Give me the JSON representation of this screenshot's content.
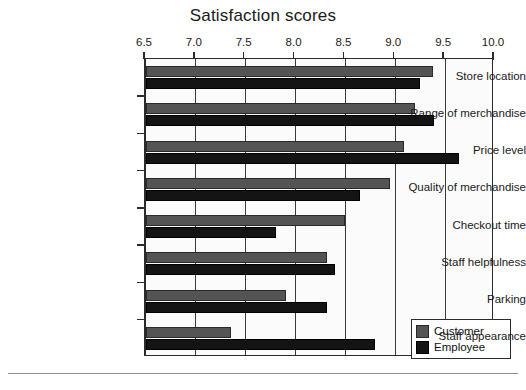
{
  "chart_data": {
    "type": "bar",
    "orientation": "horizontal",
    "grouped": true,
    "title": "Satisfaction scores",
    "xlabel": "",
    "ylabel": "",
    "xlim": [
      6.5,
      10.0
    ],
    "xticks": [
      "6.5",
      "7.0",
      "7.5",
      "8.0",
      "8.5",
      "9.0",
      "9.5",
      "10.0"
    ],
    "xtick_values": [
      6.5,
      7.0,
      7.5,
      8.0,
      8.5,
      9.0,
      9.5,
      10.0
    ],
    "grid": true,
    "legend_position": "bottom-right",
    "categories": [
      "Store location",
      "Range of merchandise",
      "Price level",
      "Quality of merchandise",
      "Checkout time",
      "Staff helpfulness",
      "Parking",
      "Staff appearance"
    ],
    "series": [
      {
        "name": "Customer",
        "color": "#545454",
        "values": [
          9.38,
          9.2,
          9.09,
          8.95,
          8.5,
          8.32,
          7.9,
          7.35
        ]
      },
      {
        "name": "Employee",
        "color": "#141414",
        "values": [
          9.25,
          9.39,
          9.64,
          8.65,
          7.8,
          8.4,
          8.32,
          8.8
        ]
      }
    ]
  },
  "legend": {
    "items": [
      {
        "label": "Customer",
        "color": "#545454"
      },
      {
        "label": "Employee",
        "color": "#141414"
      }
    ]
  }
}
